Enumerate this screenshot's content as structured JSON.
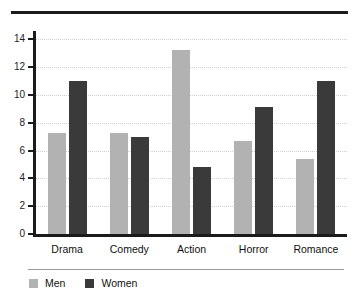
{
  "chart_data": {
    "type": "bar",
    "title": "",
    "subtitle": "",
    "xlabel": "",
    "ylabel": "",
    "categories": [
      "Drama",
      "Comedy",
      "Action",
      "Horror",
      "Romance"
    ],
    "series": [
      {
        "name": "Men",
        "color": "#b2b2b2",
        "values": [
          7.3,
          7.3,
          13.2,
          6.7,
          5.4
        ]
      },
      {
        "name": "Women",
        "color": "#3a3a3a",
        "values": [
          11.0,
          7.0,
          4.8,
          9.1,
          11.0
        ]
      }
    ],
    "ylim": [
      0,
      14.6
    ],
    "yticks": [
      0,
      2,
      4,
      6,
      8,
      10,
      12,
      14
    ],
    "ytick_labels": [
      "0",
      "2",
      "4",
      "6",
      "8",
      "10",
      "12",
      "14"
    ],
    "grid": "horizontal-dotted",
    "legend_position": "bottom-left",
    "legend_entries": [
      "Men",
      "Women"
    ]
  },
  "decor": {
    "top_rule_color": "#1b1b1b",
    "legend_rule_color": "#9a9a9a",
    "axis_color": "#1b1b1b",
    "gridline_color": "#cfcfcf"
  }
}
